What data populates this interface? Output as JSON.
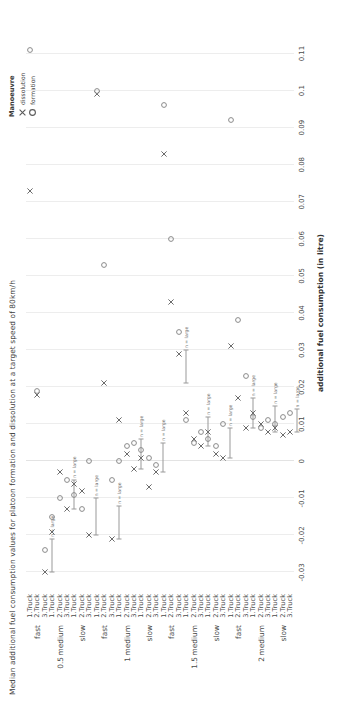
{
  "chart_data": {
    "type": "scatter",
    "title": "Median additional fuel consumption values for platoon formation and dissolution at a target speed of 80km/h",
    "xlabel": "additional fuel consumption (in litre)",
    "ylabel": "",
    "xlim": [
      -0.035,
      0.115
    ],
    "xticks": [
      -0.03,
      -0.02,
      -0.01,
      0,
      0.01,
      0.02,
      0.03,
      0.04,
      0.05,
      0.06,
      0.07,
      0.08,
      0.09,
      0.1,
      0.11
    ],
    "xticklabels": [
      "-0.03",
      "-0.02",
      "-0.01",
      "0",
      "0.01",
      "0.02",
      "0.03",
      "0.04",
      "0.05",
      "0.06",
      "0.07",
      "0.08",
      "0.09",
      "0.1",
      "0.11"
    ],
    "grid": true,
    "legend": {
      "title": "Manoeuvre",
      "position": "top-right",
      "entries": [
        {
          "label": "dissolution",
          "marker": "x",
          "color": "#5a5a5a"
        },
        {
          "label": "formation",
          "marker": "o",
          "color": "#5a5a5a"
        }
      ]
    },
    "y_levels": {
      "distance": [
        "0.5",
        "1",
        "1.5",
        "2"
      ],
      "speed": [
        "fast",
        "medium",
        "slow"
      ],
      "truck": [
        "1.Truck",
        "2.Truck",
        "3.Truck"
      ]
    },
    "y_categories": [
      {
        "distance": "0.5",
        "speed": "fast",
        "truck": "1.Truck"
      },
      {
        "distance": "0.5",
        "speed": "fast",
        "truck": "2.Truck"
      },
      {
        "distance": "0.5",
        "speed": "fast",
        "truck": "3.Truck"
      },
      {
        "distance": "0.5",
        "speed": "medium",
        "truck": "1.Truck"
      },
      {
        "distance": "0.5",
        "speed": "medium",
        "truck": "2.Truck"
      },
      {
        "distance": "0.5",
        "speed": "medium",
        "truck": "3.Truck"
      },
      {
        "distance": "0.5",
        "speed": "slow",
        "truck": "1.Truck"
      },
      {
        "distance": "0.5",
        "speed": "slow",
        "truck": "2.Truck"
      },
      {
        "distance": "0.5",
        "speed": "slow",
        "truck": "3.Truck"
      },
      {
        "distance": "1",
        "speed": "fast",
        "truck": "1.Truck"
      },
      {
        "distance": "1",
        "speed": "fast",
        "truck": "2.Truck"
      },
      {
        "distance": "1",
        "speed": "fast",
        "truck": "3.Truck"
      },
      {
        "distance": "1",
        "speed": "medium",
        "truck": "1.Truck"
      },
      {
        "distance": "1",
        "speed": "medium",
        "truck": "2.Truck"
      },
      {
        "distance": "1",
        "speed": "medium",
        "truck": "3.Truck"
      },
      {
        "distance": "1",
        "speed": "slow",
        "truck": "1.Truck"
      },
      {
        "distance": "1",
        "speed": "slow",
        "truck": "2.Truck"
      },
      {
        "distance": "1",
        "speed": "slow",
        "truck": "3.Truck"
      },
      {
        "distance": "1.5",
        "speed": "fast",
        "truck": "1.Truck"
      },
      {
        "distance": "1.5",
        "speed": "fast",
        "truck": "2.Truck"
      },
      {
        "distance": "1.5",
        "speed": "fast",
        "truck": "3.Truck"
      },
      {
        "distance": "1.5",
        "speed": "medium",
        "truck": "1.Truck"
      },
      {
        "distance": "1.5",
        "speed": "medium",
        "truck": "2.Truck"
      },
      {
        "distance": "1.5",
        "speed": "medium",
        "truck": "3.Truck"
      },
      {
        "distance": "1.5",
        "speed": "slow",
        "truck": "1.Truck"
      },
      {
        "distance": "1.5",
        "speed": "slow",
        "truck": "2.Truck"
      },
      {
        "distance": "1.5",
        "speed": "slow",
        "truck": "3.Truck"
      },
      {
        "distance": "2",
        "speed": "fast",
        "truck": "1.Truck"
      },
      {
        "distance": "2",
        "speed": "fast",
        "truck": "2.Truck"
      },
      {
        "distance": "2",
        "speed": "fast",
        "truck": "3.Truck"
      },
      {
        "distance": "2",
        "speed": "medium",
        "truck": "1.Truck"
      },
      {
        "distance": "2",
        "speed": "medium",
        "truck": "2.Truck"
      },
      {
        "distance": "2",
        "speed": "medium",
        "truck": "3.Truck"
      },
      {
        "distance": "2",
        "speed": "slow",
        "truck": "1.Truck"
      },
      {
        "distance": "2",
        "speed": "slow",
        "truck": "2.Truck"
      },
      {
        "distance": "2",
        "speed": "slow",
        "truck": "3.Truck"
      }
    ],
    "series": [
      {
        "name": "dissolution",
        "marker": "x",
        "points": [
          {
            "cat": 0,
            "x": 0.073
          },
          {
            "cat": 1,
            "x": 0.018
          },
          {
            "cat": 2,
            "x": -0.03
          },
          {
            "cat": 3,
            "x": -0.019
          },
          {
            "cat": 4,
            "x": -0.003
          },
          {
            "cat": 5,
            "x": -0.013
          },
          {
            "cat": 6,
            "x": -0.006
          },
          {
            "cat": 7,
            "x": -0.008
          },
          {
            "cat": 8,
            "x": -0.02
          },
          {
            "cat": 9,
            "x": 0.099
          },
          {
            "cat": 10,
            "x": 0.021
          },
          {
            "cat": 11,
            "x": -0.021
          },
          {
            "cat": 12,
            "x": 0.011
          },
          {
            "cat": 13,
            "x": 0.002
          },
          {
            "cat": 14,
            "x": -0.002
          },
          {
            "cat": 15,
            "x": 0.001
          },
          {
            "cat": 16,
            "x": -0.007
          },
          {
            "cat": 17,
            "x": -0.003
          },
          {
            "cat": 18,
            "x": 0.083
          },
          {
            "cat": 19,
            "x": 0.043
          },
          {
            "cat": 20,
            "x": 0.029
          },
          {
            "cat": 21,
            "x": 0.013
          },
          {
            "cat": 22,
            "x": 0.006
          },
          {
            "cat": 23,
            "x": 0.004
          },
          {
            "cat": 24,
            "x": 0.008
          },
          {
            "cat": 25,
            "x": 0.002
          },
          {
            "cat": 26,
            "x": 0.001
          },
          {
            "cat": 27,
            "x": 0.031
          },
          {
            "cat": 28,
            "x": 0.017
          },
          {
            "cat": 29,
            "x": 0.009
          },
          {
            "cat": 30,
            "x": 0.013
          },
          {
            "cat": 31,
            "x": 0.01
          },
          {
            "cat": 32,
            "x": 0.008
          },
          {
            "cat": 33,
            "x": 0.009
          },
          {
            "cat": 34,
            "x": 0.007
          },
          {
            "cat": 35,
            "x": 0.008
          }
        ]
      },
      {
        "name": "formation",
        "marker": "o",
        "points": [
          {
            "cat": 0,
            "x": 0.111
          },
          {
            "cat": 1,
            "x": 0.019
          },
          {
            "cat": 2,
            "x": -0.024
          },
          {
            "cat": 3,
            "x": -0.015
          },
          {
            "cat": 4,
            "x": -0.01
          },
          {
            "cat": 5,
            "x": -0.005
          },
          {
            "cat": 6,
            "x": -0.009
          },
          {
            "cat": 7,
            "x": -0.013
          },
          {
            "cat": 8,
            "x": 0.0
          },
          {
            "cat": 9,
            "x": 0.1
          },
          {
            "cat": 10,
            "x": 0.053
          },
          {
            "cat": 11,
            "x": -0.005
          },
          {
            "cat": 12,
            "x": 0.0
          },
          {
            "cat": 13,
            "x": 0.004
          },
          {
            "cat": 14,
            "x": 0.005
          },
          {
            "cat": 15,
            "x": 0.003
          },
          {
            "cat": 16,
            "x": 0.001
          },
          {
            "cat": 17,
            "x": -0.001
          },
          {
            "cat": 18,
            "x": 0.096
          },
          {
            "cat": 19,
            "x": 0.06
          },
          {
            "cat": 20,
            "x": 0.035
          },
          {
            "cat": 21,
            "x": 0.011
          },
          {
            "cat": 22,
            "x": 0.005
          },
          {
            "cat": 23,
            "x": 0.008
          },
          {
            "cat": 24,
            "x": 0.006
          },
          {
            "cat": 25,
            "x": 0.004
          },
          {
            "cat": 26,
            "x": 0.01
          },
          {
            "cat": 27,
            "x": 0.092
          },
          {
            "cat": 28,
            "x": 0.038
          },
          {
            "cat": 29,
            "x": 0.023
          },
          {
            "cat": 30,
            "x": 0.012
          },
          {
            "cat": 31,
            "x": 0.009
          },
          {
            "cat": 32,
            "x": 0.011
          },
          {
            "cat": 33,
            "x": 0.01
          },
          {
            "cat": 34,
            "x": 0.012
          },
          {
            "cat": 35,
            "x": 0.013
          }
        ]
      }
    ],
    "annotations": [
      {
        "cat": 2,
        "x_start": -0.03,
        "x_end": -0.021,
        "label": "n = large"
      },
      {
        "cat": 8,
        "x_start": -0.02,
        "x_end": -0.01,
        "label": "n = large"
      },
      {
        "cat": 11,
        "x_start": -0.021,
        "x_end": -0.012,
        "label": "n = large"
      },
      {
        "cat": 14,
        "x_start": -0.002,
        "x_end": 0.006,
        "label": "n = large"
      },
      {
        "cat": 17,
        "x_start": -0.003,
        "x_end": 0.005,
        "label": "n = large"
      },
      {
        "cat": 20,
        "x_start": 0.021,
        "x_end": 0.03,
        "label": "n = large"
      },
      {
        "cat": 23,
        "x_start": 0.004,
        "x_end": 0.012,
        "label": "n = large"
      },
      {
        "cat": 26,
        "x_start": 0.001,
        "x_end": 0.009,
        "label": "n = large"
      },
      {
        "cat": 29,
        "x_start": 0.009,
        "x_end": 0.017,
        "label": "n = large"
      },
      {
        "cat": 32,
        "x_start": 0.008,
        "x_end": 0.015,
        "label": "n = large"
      },
      {
        "cat": 35,
        "x_start": 0.008,
        "x_end": 0.014,
        "label": "n = large"
      },
      {
        "cat": 5,
        "x_start": -0.013,
        "x_end": -0.005,
        "label": "n = large"
      }
    ]
  }
}
